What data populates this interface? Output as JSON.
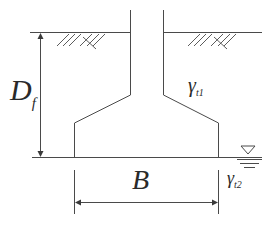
{
  "diagram": {
    "type": "shallow-foundation-cross-section",
    "labels": {
      "depth": {
        "main": "D",
        "sub": "f"
      },
      "width": {
        "main": "B"
      },
      "unit_weight_above": {
        "main": "γ",
        "sub": "t1"
      },
      "unit_weight_below": {
        "main": "γ",
        "sub": "t2"
      }
    },
    "symbols": [
      "ground-surface-hatch",
      "water-table-symbol"
    ],
    "colors": {
      "line": "#4a4a4a",
      "text": "#2a2a2a",
      "background": "#ffffff"
    }
  }
}
